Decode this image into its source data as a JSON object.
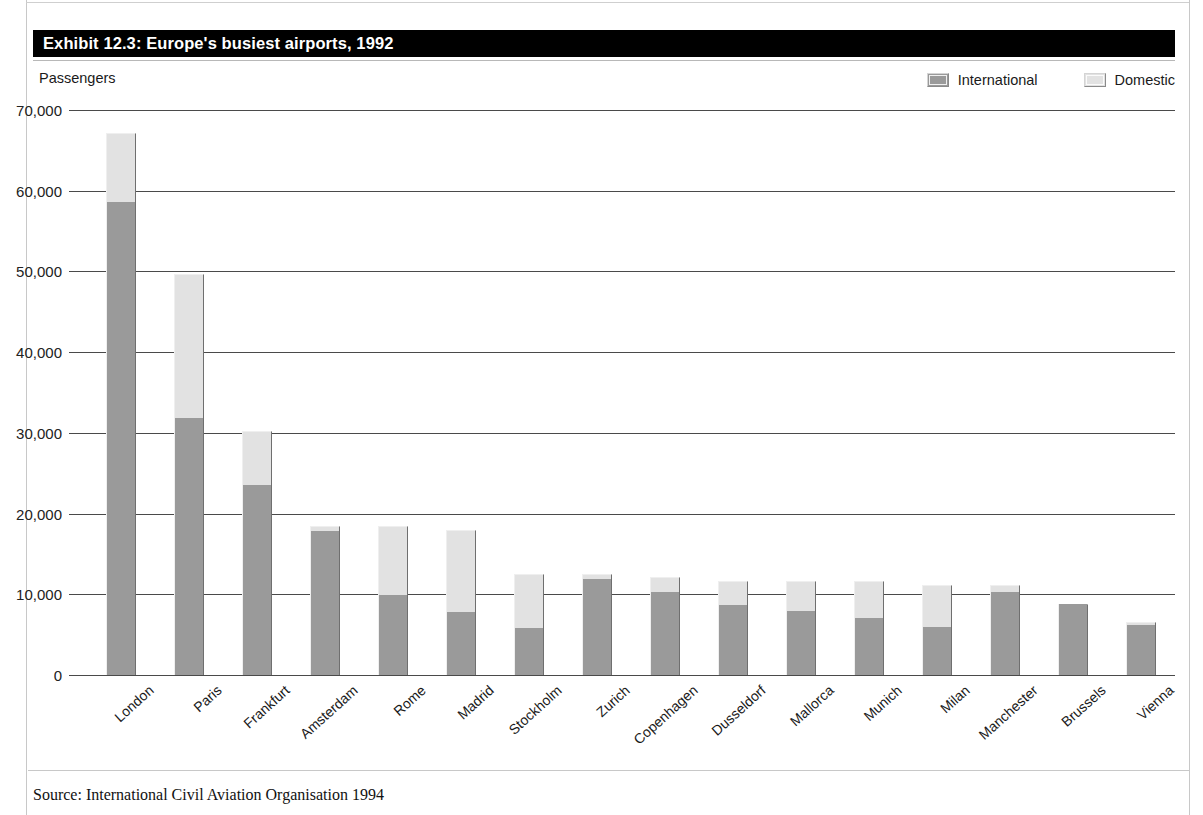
{
  "exhibit": {
    "title": "Exhibit 12.3: Europe's busiest airports, 1992",
    "axis_title": "Passengers",
    "source": "Source: International Civil Aviation Organisation 1994"
  },
  "legend": {
    "items": [
      {
        "label": "International",
        "color": "#9a9a9a",
        "icon": "legend-swatch-icon"
      },
      {
        "label": "Domestic",
        "color": "#e2e2e2",
        "icon": "legend-swatch-icon"
      }
    ]
  },
  "chart_data": {
    "type": "bar",
    "stacked": true,
    "title": "Exhibit 12.3: Europe's busiest airports, 1992",
    "subtitle": "",
    "xlabel": "",
    "ylabel": "Passengers",
    "ylim": [
      0,
      70000
    ],
    "yticks": [
      0,
      10000,
      20000,
      30000,
      40000,
      50000,
      60000,
      70000
    ],
    "ytick_labels": [
      "0",
      "10,000",
      "20,000",
      "30,000",
      "40,000",
      "50,000",
      "60,000",
      "70,000"
    ],
    "grid": true,
    "legend_position": "top-right",
    "categories": [
      "London",
      "Paris",
      "Frankfurt",
      "Amsterdam",
      "Rome",
      "Madrid",
      "Stockholm",
      "Zurich",
      "Copenhagen",
      "Dusseldorf",
      "Mallorca",
      "Munich",
      "Milan",
      "Manchester",
      "Brussels",
      "Vienna"
    ],
    "series": [
      {
        "name": "International",
        "color": "#9a9a9a",
        "values": [
          58600,
          31800,
          23500,
          17900,
          9900,
          7800,
          5800,
          11900,
          10300,
          8700,
          7900,
          7100,
          6000,
          10300,
          8800,
          6200
        ]
      },
      {
        "name": "Domestic",
        "color": "#e2e2e2",
        "values": [
          8500,
          17900,
          6700,
          500,
          8600,
          10200,
          6700,
          600,
          1900,
          3000,
          3800,
          4600,
          5200,
          900,
          0,
          400
        ]
      }
    ],
    "totals": [
      67100,
      49700,
      30200,
      18400,
      18500,
      18000,
      12500,
      12500,
      12200,
      11700,
      11700,
      11700,
      11200,
      11200,
      8800,
      6600
    ]
  }
}
